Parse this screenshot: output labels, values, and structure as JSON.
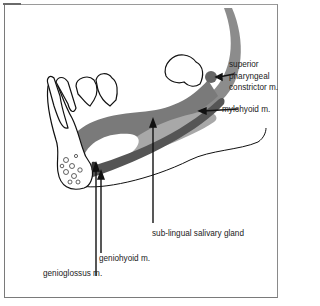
{
  "diagram": {
    "labels": {
      "superior_pharyngeal": [
        "superior",
        "pharyngeal",
        "constrictor m."
      ],
      "mylohyoid": "mylohyoid m.",
      "sublingual": "sub-lingual salivary gland",
      "geniohyoid": "geniohyoid m.",
      "genioglossus": "genioglossus m."
    },
    "colors": {
      "mylohyoid_band": "#555555",
      "constrictor_band": "#8c8c8c",
      "gland": "#a8a8a8",
      "gum": "#7a7a7a",
      "outline": "#111111",
      "frame": "#7a7a7a"
    }
  }
}
